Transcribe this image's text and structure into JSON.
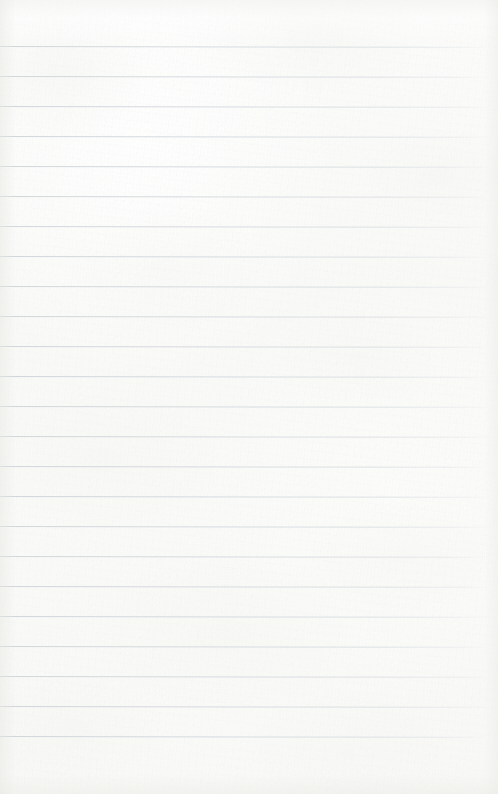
{
  "document": {
    "type": "blank-ruled-paper",
    "title": "Blank ruled notebook paper",
    "page_width": 498,
    "page_height": 794,
    "has_text": false,
    "has_handwriting": false,
    "text_content": ""
  },
  "paper": {
    "background_color": "#fbfbfa",
    "tint_description": "warm off-white scanned paper",
    "texture": "subtle fibre grain with soft mottling",
    "edge_vignette_color": "#e9e9e5"
  },
  "ruling": {
    "line_color": "#ced4d9",
    "line_thickness_px": 1,
    "line_spacing_px": 30,
    "first_line_y": 46,
    "last_line_y": 736,
    "line_count": 24,
    "left_margin_px": 0,
    "right_end_x": 487,
    "margin_rule_present": false,
    "line_y_positions": [
      46,
      76,
      106,
      136,
      166,
      196,
      226,
      256,
      286,
      316,
      346,
      376,
      406,
      436,
      466,
      496,
      526,
      556,
      586,
      616,
      646,
      676,
      706,
      736
    ],
    "line_widths": [
      487,
      487,
      486,
      487,
      488,
      487,
      486,
      487,
      488,
      487,
      486,
      487,
      487,
      488,
      486,
      487,
      487,
      486,
      488,
      487,
      486,
      487,
      488,
      487
    ]
  },
  "margins": {
    "top_blank_height": 46,
    "bottom_blank_height": 58
  }
}
